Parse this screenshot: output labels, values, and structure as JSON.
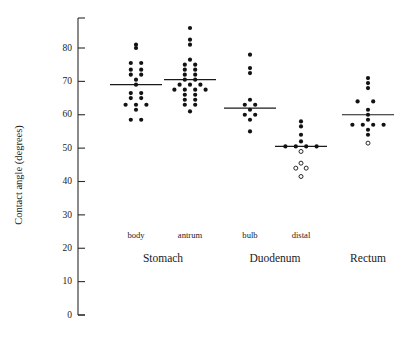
{
  "chart_data": {
    "type": "scatter",
    "title": "",
    "xlabel": "",
    "ylabel": "Contact angle (degrees)",
    "ylim": [
      0,
      88
    ],
    "yticks": [
      0,
      10,
      20,
      30,
      40,
      50,
      60,
      70,
      80
    ],
    "ytick_labels": [
      "0",
      "10",
      "20",
      "30",
      "40",
      "50",
      "60",
      "70",
      "80"
    ],
    "grid": false,
    "legend": "none",
    "marker_styles": {
      "filled": "filled-circle",
      "open": "open-circle"
    },
    "region_groups": [
      {
        "label": "Stomach",
        "x": 163,
        "subgroups": [
          "body",
          "antrum"
        ]
      },
      {
        "label": "Duodenum",
        "x": 275,
        "subgroups": [
          "bulb",
          "distal"
        ]
      },
      {
        "label": "Rectum",
        "x": 368,
        "subgroups": [
          "rectum"
        ]
      }
    ],
    "series": [
      {
        "name": "body",
        "label": "body",
        "x_center": 136,
        "mean": 69.0,
        "n": 20,
        "points": [
          {
            "value": 81.0,
            "offset": 0,
            "open": false
          },
          {
            "value": 80.0,
            "offset": 0,
            "open": false
          },
          {
            "value": 75.5,
            "offset": -1,
            "open": false
          },
          {
            "value": 75.5,
            "offset": 1,
            "open": false
          },
          {
            "value": 73.5,
            "offset": -1,
            "open": false
          },
          {
            "value": 73.5,
            "offset": 1,
            "open": false
          },
          {
            "value": 72.0,
            "offset": -1,
            "open": false
          },
          {
            "value": 72.0,
            "offset": 1,
            "open": false
          },
          {
            "value": 70.5,
            "offset": 0,
            "open": false
          },
          {
            "value": 69.0,
            "offset": 0,
            "open": false
          },
          {
            "value": 66.5,
            "offset": -1,
            "open": false
          },
          {
            "value": 66.5,
            "offset": 1,
            "open": false
          },
          {
            "value": 65.0,
            "offset": -1,
            "open": false
          },
          {
            "value": 65.0,
            "offset": 1,
            "open": false
          },
          {
            "value": 63.0,
            "offset": -2,
            "open": false
          },
          {
            "value": 63.0,
            "offset": 0,
            "open": false
          },
          {
            "value": 63.0,
            "offset": 2,
            "open": false
          },
          {
            "value": 61.5,
            "offset": 0,
            "open": false
          },
          {
            "value": 58.5,
            "offset": -1,
            "open": false
          },
          {
            "value": 58.5,
            "offset": 1,
            "open": false
          }
        ]
      },
      {
        "name": "antrum",
        "label": "antrum",
        "x_center": 190,
        "mean": 70.5,
        "n": 26,
        "points": [
          {
            "value": 86.0,
            "offset": 0,
            "open": false
          },
          {
            "value": 82.5,
            "offset": 0,
            "open": false
          },
          {
            "value": 81.0,
            "offset": 0,
            "open": false
          },
          {
            "value": 76.5,
            "offset": 0,
            "open": false
          },
          {
            "value": 75.0,
            "offset": -1,
            "open": false
          },
          {
            "value": 75.0,
            "offset": 1,
            "open": false
          },
          {
            "value": 73.5,
            "offset": -1,
            "open": false
          },
          {
            "value": 73.5,
            "offset": 1,
            "open": false
          },
          {
            "value": 72.0,
            "offset": -1,
            "open": false
          },
          {
            "value": 72.0,
            "offset": 1,
            "open": false
          },
          {
            "value": 70.5,
            "offset": -1,
            "open": false
          },
          {
            "value": 70.5,
            "offset": 1,
            "open": false
          },
          {
            "value": 69.0,
            "offset": -2,
            "open": false
          },
          {
            "value": 69.0,
            "offset": 0,
            "open": false
          },
          {
            "value": 69.0,
            "offset": 2,
            "open": false
          },
          {
            "value": 67.5,
            "offset": -3,
            "open": false
          },
          {
            "value": 67.5,
            "offset": -1,
            "open": false
          },
          {
            "value": 67.5,
            "offset": 1,
            "open": false
          },
          {
            "value": 67.5,
            "offset": 3,
            "open": false
          },
          {
            "value": 66.0,
            "offset": -1,
            "open": false
          },
          {
            "value": 66.0,
            "offset": 1,
            "open": false
          },
          {
            "value": 64.5,
            "offset": -1,
            "open": false
          },
          {
            "value": 64.5,
            "offset": 1,
            "open": false
          },
          {
            "value": 63.0,
            "offset": -1,
            "open": false
          },
          {
            "value": 63.0,
            "offset": 1,
            "open": false
          },
          {
            "value": 61.0,
            "offset": 0,
            "open": false
          }
        ]
      },
      {
        "name": "bulb",
        "label": "bulb",
        "x_center": 250,
        "mean": 62.0,
        "n": 11,
        "points": [
          {
            "value": 78.0,
            "offset": 0,
            "open": false
          },
          {
            "value": 74.0,
            "offset": 0,
            "open": false
          },
          {
            "value": 72.5,
            "offset": 0,
            "open": false
          },
          {
            "value": 64.5,
            "offset": 0,
            "open": false
          },
          {
            "value": 63.0,
            "offset": -1,
            "open": false
          },
          {
            "value": 63.0,
            "offset": 1,
            "open": false
          },
          {
            "value": 61.5,
            "offset": 0,
            "open": false
          },
          {
            "value": 60.0,
            "offset": -1,
            "open": false
          },
          {
            "value": 60.0,
            "offset": 1,
            "open": false
          },
          {
            "value": 58.5,
            "offset": 0,
            "open": false
          },
          {
            "value": 55.0,
            "offset": 0,
            "open": false
          }
        ]
      },
      {
        "name": "distal",
        "label": "distal",
        "x_center": 301,
        "mean": 50.5,
        "n": 13,
        "points": [
          {
            "value": 58.0,
            "offset": 0,
            "open": false
          },
          {
            "value": 56.5,
            "offset": 0,
            "open": false
          },
          {
            "value": 54.0,
            "offset": 0,
            "open": false
          },
          {
            "value": 52.0,
            "offset": 0,
            "open": false
          },
          {
            "value": 50.5,
            "offset": -3,
            "open": false
          },
          {
            "value": 50.5,
            "offset": -1,
            "open": false
          },
          {
            "value": 50.5,
            "offset": 1,
            "open": false
          },
          {
            "value": 50.5,
            "offset": 3,
            "open": false
          },
          {
            "value": 49.0,
            "offset": 0,
            "open": true
          },
          {
            "value": 45.5,
            "offset": 0,
            "open": true
          },
          {
            "value": 44.0,
            "offset": -1,
            "open": true
          },
          {
            "value": 44.0,
            "offset": 1,
            "open": true
          },
          {
            "value": 41.5,
            "offset": 0,
            "open": true
          }
        ]
      },
      {
        "name": "rectum",
        "label": "",
        "x_center": 368,
        "mean": 60.0,
        "n": 15,
        "points": [
          {
            "value": 71.0,
            "offset": 0,
            "open": false
          },
          {
            "value": 69.5,
            "offset": 0,
            "open": false
          },
          {
            "value": 68.0,
            "offset": 0,
            "open": false
          },
          {
            "value": 64.0,
            "offset": -2,
            "open": false
          },
          {
            "value": 64.0,
            "offset": 1,
            "open": false
          },
          {
            "value": 61.5,
            "offset": 0,
            "open": false
          },
          {
            "value": 60.0,
            "offset": 0,
            "open": false
          },
          {
            "value": 58.5,
            "offset": 0,
            "open": false
          },
          {
            "value": 57.0,
            "offset": -3,
            "open": false
          },
          {
            "value": 57.0,
            "offset": -1,
            "open": false
          },
          {
            "value": 57.0,
            "offset": 1,
            "open": false
          },
          {
            "value": 57.0,
            "offset": 3,
            "open": false
          },
          {
            "value": 55.5,
            "offset": 0,
            "open": false
          },
          {
            "value": 54.0,
            "offset": 0,
            "open": false
          },
          {
            "value": 51.5,
            "offset": 0,
            "open": true
          }
        ]
      }
    ],
    "colors": {
      "axis": "#2b2b2b",
      "marker": "#121212",
      "mean_line": "#1a1a1a",
      "background": "#ffffff"
    }
  }
}
